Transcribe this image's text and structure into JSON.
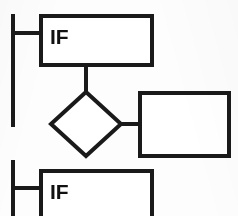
{
  "diagram": {
    "background_color": "#fdfdfd",
    "line_color": "#1a1a1a",
    "fill_color": "#ffffff",
    "rails": [
      {
        "name": "power-rail-upper",
        "x": 13,
        "y1": 14,
        "y2": 127,
        "width": 4
      },
      {
        "name": "power-rail-lower",
        "x": 13,
        "y1": 160,
        "y2": 216,
        "width": 4
      }
    ],
    "nodes": [
      {
        "id": "if-top",
        "shape": "rectangle",
        "label": "IF",
        "x": 41,
        "y": 16,
        "w": 111,
        "h": 49,
        "stroke_width": 4,
        "label_x": 50,
        "label_y": 44,
        "label_size": 21
      },
      {
        "id": "decision",
        "shape": "diamond",
        "label": "",
        "cx": 86,
        "cy": 124,
        "rx": 35,
        "ry": 32,
        "stroke_width": 4
      },
      {
        "id": "action",
        "shape": "rectangle",
        "label": "",
        "x": 140,
        "y": 93,
        "w": 89,
        "h": 63,
        "stroke_width": 4
      },
      {
        "id": "if-bottom",
        "shape": "rectangle",
        "label": "IF",
        "x": 41,
        "y": 171,
        "w": 111,
        "h": 49,
        "stroke_width": 4,
        "label_x": 50,
        "label_y": 199,
        "label_size": 21
      }
    ],
    "connectors": [
      {
        "name": "rail-to-if-top",
        "x1": 13,
        "y1": 33,
        "x2": 43,
        "y2": 33,
        "width": 4
      },
      {
        "name": "if-top-to-decision",
        "x1": 86,
        "y1": 63,
        "x2": 86,
        "y2": 94,
        "width": 4
      },
      {
        "name": "decision-to-action",
        "x1": 119,
        "y1": 124,
        "x2": 142,
        "y2": 124,
        "width": 4
      },
      {
        "name": "rail-to-if-bottom",
        "x1": 13,
        "y1": 188,
        "x2": 43,
        "y2": 188,
        "width": 4
      }
    ]
  }
}
